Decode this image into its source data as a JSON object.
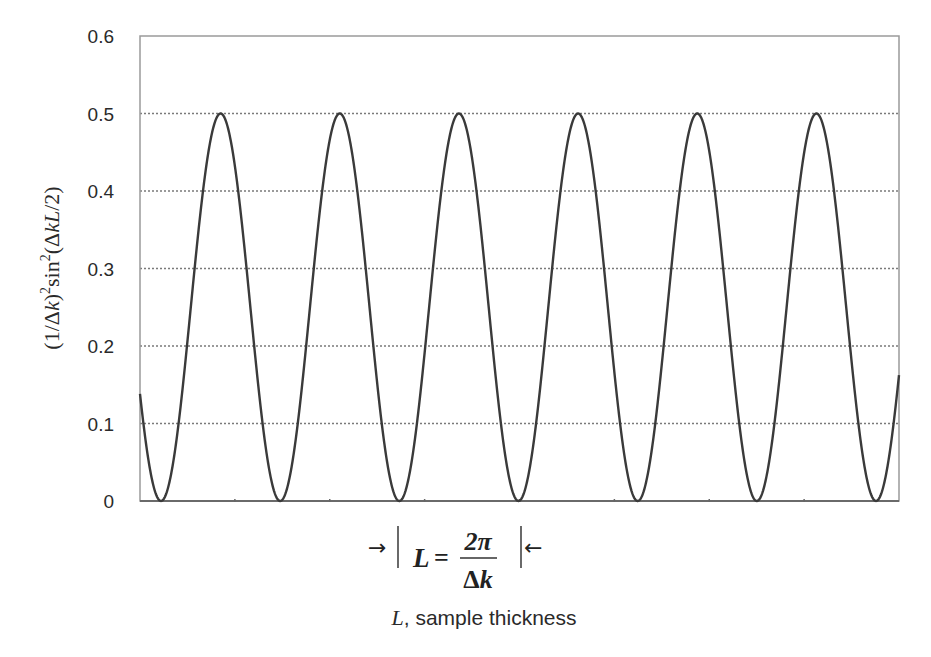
{
  "chart_data": {
    "type": "line",
    "title": "",
    "xlabel": "L, sample thickness",
    "xlabel_italic_part": "L",
    "xlabel_rest": ", sample thickness",
    "ylabel": "(1/Δk)²sin²(ΔkL/2)",
    "ylabel_parts": {
      "prefix": "(1/Δ",
      "k1": "k",
      "mid": ")",
      "sup1": "2",
      "sin": "sin",
      "sup2": "2",
      "open": "(Δ",
      "kL": "kL",
      "suffix": "/2)"
    },
    "ylim": [
      0,
      0.6
    ],
    "yticks": [
      0,
      0.1,
      0.2,
      0.3,
      0.4,
      0.5,
      0.6
    ],
    "ytick_labels": [
      "0",
      "0.1",
      "0.2",
      "0.3",
      "0.4",
      "0.5",
      "0.6"
    ],
    "grid": {
      "y": true,
      "x": false,
      "style": "dotted",
      "lines": [
        0.1,
        0.2,
        0.3,
        0.4,
        0.5
      ]
    },
    "x_minor_ticks": 7,
    "series": [
      {
        "name": "(1/Δk)²sin²(ΔkL/2)",
        "amplitude": 0.5,
        "periods_visible": 6.4,
        "trough_positions_px": [
          161,
          280,
          398,
          518,
          636,
          757,
          876
        ],
        "peak_positions_px": [
          220,
          339,
          458,
          579,
          698,
          817
        ],
        "value_at_left_edge": 0.14,
        "value_at_right_edge": 0.15,
        "peak_value": 0.5,
        "trough_value": 0,
        "color": "#3a3a3a"
      }
    ],
    "annotation": {
      "left_arrow": "→",
      "right_arrow": "←",
      "formula_lhs": "L",
      "formula_eq": "=",
      "formula_num": "2π",
      "formula_den_delta": "Δ",
      "formula_den_k": "k",
      "meaning": "L = 2π/Δk (one period)"
    },
    "colors": {
      "curve": "#3a3a3a",
      "axes": "#8a8a8a",
      "grid": "#7a7a7a",
      "text": "#2a2a2a"
    }
  }
}
